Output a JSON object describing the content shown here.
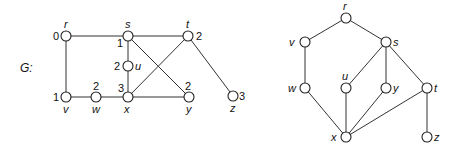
{
  "graph_label": "G:",
  "left_graph": {
    "nodes": [
      {
        "id": "r",
        "x": 66,
        "y": 36,
        "label": "r",
        "lx": 64,
        "ly": 28,
        "dist": "0",
        "dx": 53,
        "dy": 40
      },
      {
        "id": "s",
        "x": 128,
        "y": 36,
        "label": "s",
        "lx": 125,
        "ly": 28,
        "dist": "1",
        "dx": 117,
        "dy": 47
      },
      {
        "id": "t",
        "x": 188,
        "y": 36,
        "label": "t",
        "lx": 186,
        "ly": 28,
        "dist": "2",
        "dx": 196,
        "dy": 40
      },
      {
        "id": "u",
        "x": 128,
        "y": 66,
        "label": "u",
        "lx": 135,
        "ly": 70,
        "dist": "2",
        "dx": 114,
        "dy": 70
      },
      {
        "id": "v",
        "x": 66,
        "y": 97,
        "label": "v",
        "lx": 63,
        "ly": 113,
        "dist": "1",
        "dx": 53,
        "dy": 101
      },
      {
        "id": "w",
        "x": 96,
        "y": 97,
        "label": "w",
        "lx": 92,
        "ly": 113,
        "dist": "2",
        "dx": 93,
        "dy": 90
      },
      {
        "id": "x",
        "x": 128,
        "y": 97,
        "label": "x",
        "lx": 124,
        "ly": 113,
        "dist": "3",
        "dx": 118,
        "dy": 92
      },
      {
        "id": "y",
        "x": 189,
        "y": 97,
        "label": "y",
        "lx": 186,
        "ly": 113,
        "dist": "2",
        "dx": 185,
        "dy": 90
      },
      {
        "id": "z",
        "x": 233,
        "y": 96,
        "label": "z",
        "lx": 230,
        "ly": 112,
        "dist": "3",
        "dx": 239,
        "dy": 100
      }
    ],
    "edges": [
      [
        "r",
        "s"
      ],
      [
        "s",
        "t"
      ],
      [
        "r",
        "v"
      ],
      [
        "s",
        "u"
      ],
      [
        "u",
        "x"
      ],
      [
        "s",
        "y"
      ],
      [
        "t",
        "x"
      ],
      [
        "t",
        "z"
      ],
      [
        "v",
        "w"
      ],
      [
        "w",
        "x"
      ],
      [
        "x",
        "y"
      ]
    ]
  },
  "right_graph": {
    "nodes": [
      {
        "id": "r",
        "x": 346,
        "y": 18,
        "label": "r",
        "lx": 343,
        "ly": 10
      },
      {
        "id": "v",
        "x": 305,
        "y": 42,
        "label": "v",
        "lx": 289,
        "ly": 46
      },
      {
        "id": "s",
        "x": 386,
        "y": 42,
        "label": "s",
        "lx": 393,
        "ly": 46
      },
      {
        "id": "w",
        "x": 305,
        "y": 88,
        "label": "w",
        "lx": 288,
        "ly": 92
      },
      {
        "id": "u",
        "x": 346,
        "y": 88,
        "label": "u",
        "lx": 342,
        "ly": 80
      },
      {
        "id": "y",
        "x": 386,
        "y": 88,
        "label": "y",
        "lx": 393,
        "ly": 92
      },
      {
        "id": "t",
        "x": 427,
        "y": 88,
        "label": "t",
        "lx": 434,
        "ly": 92
      },
      {
        "id": "x",
        "x": 346,
        "y": 137,
        "label": "x",
        "lx": 331,
        "ly": 141
      },
      {
        "id": "z",
        "x": 427,
        "y": 137,
        "label": "z",
        "lx": 434,
        "ly": 141
      }
    ],
    "edges": [
      [
        "r",
        "v"
      ],
      [
        "r",
        "s"
      ],
      [
        "v",
        "w"
      ],
      [
        "s",
        "u"
      ],
      [
        "s",
        "y"
      ],
      [
        "s",
        "t"
      ],
      [
        "w",
        "x"
      ],
      [
        "u",
        "x"
      ],
      [
        "y",
        "x"
      ],
      [
        "t",
        "x"
      ],
      [
        "t",
        "z"
      ]
    ]
  }
}
